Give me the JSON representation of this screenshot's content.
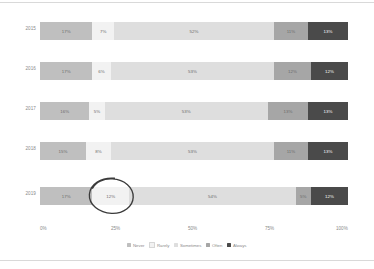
{
  "chart_data": {
    "type": "bar",
    "orientation": "horizontal",
    "stacked": true,
    "normalized": "100%",
    "title": "",
    "xlabel": "",
    "ylabel": "",
    "xlim": [
      0,
      100
    ],
    "grid": false,
    "legend_position": "bottom",
    "categories": [
      "2015",
      "2016",
      "2017",
      "2018",
      "2019"
    ],
    "series": [
      {
        "name": "Never",
        "color": "#bfbfbf",
        "values": [
          17,
          17,
          16,
          15,
          17
        ]
      },
      {
        "name": "Rarely",
        "color": "#f2f2f2",
        "values": [
          7,
          6,
          5,
          8,
          12
        ]
      },
      {
        "name": "Sometimes",
        "color": "#dedede",
        "values": [
          52,
          53,
          53,
          53,
          54
        ]
      },
      {
        "name": "Often",
        "color": "#a6a6a6",
        "values": [
          11,
          12,
          13,
          11,
          5
        ]
      },
      {
        "name": "Always",
        "color": "#4a4a4a",
        "values": [
          13,
          12,
          13,
          13,
          12
        ]
      }
    ],
    "bar_labels": [
      [
        "17%",
        "7%",
        "52%",
        "11%",
        "13%"
      ],
      [
        "17%",
        "6%",
        "53%",
        "12%",
        "12%"
      ],
      [
        "16%",
        "5%",
        "53%",
        "13%",
        "13%"
      ],
      [
        "15%",
        "8%",
        "53%",
        "11%",
        "13%"
      ],
      [
        "17%",
        "12%",
        "54%",
        "5%",
        "12%"
      ]
    ],
    "xticks": [
      "0%",
      "25%",
      "50%",
      "75%",
      "100%"
    ],
    "xtick_values": [
      0,
      25,
      50,
      75,
      100
    ],
    "annotations": [
      {
        "kind": "hand-drawn-ellipse",
        "target_row": "2019",
        "target_series": "Rarely",
        "target_label": "12%",
        "color": "#3b3b3b"
      }
    ]
  },
  "legend": {
    "items": [
      {
        "label": "Never",
        "color": "#bfbfbf"
      },
      {
        "label": "Rarely",
        "color": "#f2f2f2"
      },
      {
        "label": "Sometimes",
        "color": "#dedede"
      },
      {
        "label": "Often",
        "color": "#a6a6a6"
      },
      {
        "label": "Always",
        "color": "#4a4a4a"
      }
    ]
  },
  "colors": {
    "background": "#ffffff",
    "axis_text": "#8a8a8a",
    "label_dark": "#ffffff",
    "label_light": "#6b6b6b",
    "rule": "#d9d9d9",
    "annotation": "#3b3b3b"
  }
}
